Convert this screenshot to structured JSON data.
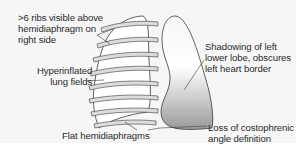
{
  "diagram": {
    "type": "annotated medical illustration",
    "colors": {
      "background_panel": "#f6f6f6",
      "outline": "#3a3a3a",
      "rib_fill": "#dcdcdc",
      "shading_light": "#ffffff",
      "shading_dark": "#9a9a9a",
      "text": "#2b2b2b"
    },
    "structures": [
      {
        "name": "right-lung",
        "description": "Hyperinflated right lung with ribs overlaid",
        "ribs_visible": 8
      },
      {
        "name": "left-lung",
        "description": "Left lung with shaded lower lobe"
      }
    ],
    "annotations": [
      {
        "id": "ribs",
        "lines": [
          ">6 ribs visible above",
          "hemidiaphragm on",
          "right side"
        ],
        "text": ">6 ribs visible above\nhemidiaphragm on\nright side"
      },
      {
        "id": "hyper",
        "lines": [
          "Hyperinflated",
          "lung fields"
        ],
        "text": "Hyperinflated\n   lung fields"
      },
      {
        "id": "flat",
        "lines": [
          "Flat hemidiaphragms"
        ],
        "text": "Flat hemidiaphragms"
      },
      {
        "id": "shadow",
        "lines": [
          "Shadowing of left",
          "lower lobe, obscures",
          "left heart border"
        ],
        "text": "Shadowing of left\nlower lobe, obscures\nleft heart border"
      },
      {
        "id": "loss",
        "lines": [
          "Loss of costophrenic",
          "angle definition"
        ],
        "text": "Loss of costophrenic\nangle definition"
      }
    ]
  }
}
